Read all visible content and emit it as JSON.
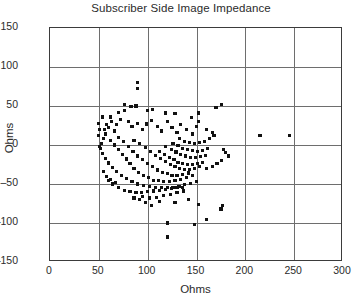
{
  "chart_data": {
    "type": "scatter",
    "title": "Subscriber Side Image Impedance",
    "xlabel": "Ohms",
    "ylabel": "Ohms",
    "xlim": [
      0,
      300
    ],
    "ylim": [
      -150,
      150
    ],
    "xticks": [
      0,
      50,
      100,
      150,
      200,
      250,
      300
    ],
    "yticks": [
      -150,
      -100,
      -50,
      0,
      50,
      100,
      150
    ],
    "grid": true,
    "legend": null,
    "marker": "square",
    "marker_color": "#111111",
    "series": [
      {
        "name": "Image Impedance",
        "points": [
          [
            90,
            80
          ],
          [
            90,
            72
          ],
          [
            88,
            50
          ],
          [
            83,
            49
          ],
          [
            105,
            46
          ],
          [
            118,
            41
          ],
          [
            128,
            40
          ],
          [
            152,
            41
          ],
          [
            100,
            44
          ],
          [
            76,
            52
          ],
          [
            63,
            30
          ],
          [
            68,
            26
          ],
          [
            72,
            33
          ],
          [
            60,
            22
          ],
          [
            66,
            18
          ],
          [
            80,
            30
          ],
          [
            84,
            24
          ],
          [
            90,
            28
          ],
          [
            95,
            20
          ],
          [
            99,
            27
          ],
          [
            104,
            31
          ],
          [
            110,
            24
          ],
          [
            114,
            18
          ],
          [
            120,
            30
          ],
          [
            125,
            22
          ],
          [
            130,
            16
          ],
          [
            134,
            26
          ],
          [
            140,
            20
          ],
          [
            146,
            14
          ],
          [
            150,
            24
          ],
          [
            57,
            14
          ],
          [
            55,
            8
          ],
          [
            53,
            2
          ],
          [
            52,
            -4
          ],
          [
            54,
            -11
          ],
          [
            57,
            -17
          ],
          [
            60,
            -23
          ],
          [
            64,
            -29
          ],
          [
            68,
            -34
          ],
          [
            73,
            -39
          ],
          [
            78,
            -43
          ],
          [
            84,
            -47
          ],
          [
            90,
            -50
          ],
          [
            96,
            -52
          ],
          [
            102,
            -53
          ],
          [
            108,
            -54
          ],
          [
            114,
            -55
          ],
          [
            120,
            -55
          ],
          [
            126,
            -54
          ],
          [
            132,
            -53
          ],
          [
            138,
            -51
          ],
          [
            144,
            -49
          ],
          [
            150,
            -47
          ],
          [
            62,
            6
          ],
          [
            66,
            0
          ],
          [
            70,
            -6
          ],
          [
            74,
            -12
          ],
          [
            78,
            -18
          ],
          [
            82,
            -24
          ],
          [
            86,
            -30
          ],
          [
            91,
            -35
          ],
          [
            96,
            -39
          ],
          [
            101,
            -42
          ],
          [
            106,
            -45
          ],
          [
            111,
            -46
          ],
          [
            116,
            -47
          ],
          [
            122,
            -47
          ],
          [
            128,
            -46
          ],
          [
            134,
            -44
          ],
          [
            140,
            -42
          ],
          [
            146,
            -39
          ],
          [
            70,
            10
          ],
          [
            75,
            4
          ],
          [
            80,
            -2
          ],
          [
            85,
            -8
          ],
          [
            90,
            -14
          ],
          [
            95,
            -19
          ],
          [
            100,
            -24
          ],
          [
            105,
            -28
          ],
          [
            110,
            -32
          ],
          [
            115,
            -35
          ],
          [
            120,
            -37
          ],
          [
            125,
            -39
          ],
          [
            130,
            -39
          ],
          [
            136,
            -38
          ],
          [
            142,
            -36
          ],
          [
            86,
            6
          ],
          [
            92,
            2
          ],
          [
            98,
            -3
          ],
          [
            103,
            -8
          ],
          [
            108,
            -13
          ],
          [
            113,
            -17
          ],
          [
            118,
            -21
          ],
          [
            123,
            -25
          ],
          [
            128,
            -28
          ],
          [
            133,
            -30
          ],
          [
            138,
            -31
          ],
          [
            143,
            -31
          ],
          [
            148,
            -30
          ],
          [
            153,
            -28
          ],
          [
            112,
            -8
          ],
          [
            117,
            -12
          ],
          [
            122,
            -16
          ],
          [
            127,
            -19
          ],
          [
            131,
            -22
          ],
          [
            136,
            -24
          ],
          [
            141,
            -25
          ],
          [
            146,
            -25
          ],
          [
            151,
            -24
          ],
          [
            156,
            -22
          ],
          [
            118,
            -2
          ],
          [
            124,
            -6
          ],
          [
            129,
            -9
          ],
          [
            134,
            -12
          ],
          [
            139,
            -14
          ],
          [
            144,
            -16
          ],
          [
            149,
            -16
          ],
          [
            154,
            -15
          ],
          [
            159,
            -13
          ],
          [
            126,
            2
          ],
          [
            131,
            -1
          ],
          [
            136,
            -4
          ],
          [
            141,
            -6
          ],
          [
            146,
            -7
          ],
          [
            151,
            -8
          ],
          [
            156,
            -7
          ],
          [
            161,
            -5
          ],
          [
            133,
            8
          ],
          [
            138,
            5
          ],
          [
            143,
            3
          ],
          [
            148,
            2
          ],
          [
            153,
            3
          ],
          [
            158,
            5
          ],
          [
            163,
            8
          ],
          [
            168,
            12
          ],
          [
            60,
            -45
          ],
          [
            64,
            -50
          ],
          [
            70,
            -55
          ],
          [
            76,
            -58
          ],
          [
            82,
            -60
          ],
          [
            88,
            -61
          ],
          [
            94,
            -61
          ],
          [
            100,
            -60
          ],
          [
            106,
            -59
          ],
          [
            112,
            -58
          ],
          [
            118,
            -57
          ],
          [
            124,
            -56
          ],
          [
            130,
            -55
          ],
          [
            136,
            -54
          ],
          [
            95,
            -66
          ],
          [
            102,
            -68
          ],
          [
            109,
            -67
          ],
          [
            116,
            -65
          ],
          [
            123,
            -63
          ],
          [
            130,
            -61
          ],
          [
            137,
            -59
          ],
          [
            56,
            20
          ],
          [
            58,
            26
          ],
          [
            62,
            36
          ],
          [
            70,
            42
          ],
          [
            76,
            44
          ],
          [
            54,
            36
          ],
          [
            50,
            28
          ],
          [
            51,
            20
          ],
          [
            50,
            12
          ],
          [
            51,
            -2
          ],
          [
            55,
            -34
          ],
          [
            58,
            -40
          ],
          [
            62,
            -44
          ],
          [
            67,
            -48
          ],
          [
            160,
            -30
          ],
          [
            166,
            -28
          ],
          [
            171,
            -24
          ],
          [
            176,
            -20
          ],
          [
            160,
            20
          ],
          [
            166,
            16
          ],
          [
            152,
            30
          ],
          [
            145,
            35
          ],
          [
            170,
            48
          ],
          [
            176,
            52
          ],
          [
            215,
            12
          ],
          [
            245,
            12
          ],
          [
            178,
            -6
          ],
          [
            180,
            -10
          ],
          [
            183,
            -14
          ],
          [
            120,
            -100
          ],
          [
            160,
            -96
          ],
          [
            175,
            -82
          ],
          [
            177,
            -78
          ],
          [
            148,
            -102
          ],
          [
            120,
            -118
          ],
          [
            112,
            -72
          ],
          [
            128,
            -74
          ],
          [
            142,
            -70
          ],
          [
            152,
            -76
          ],
          [
            104,
            -78
          ],
          [
            98,
            -74
          ],
          [
            92,
            -70
          ],
          [
            86,
            -68
          ]
        ]
      }
    ]
  }
}
